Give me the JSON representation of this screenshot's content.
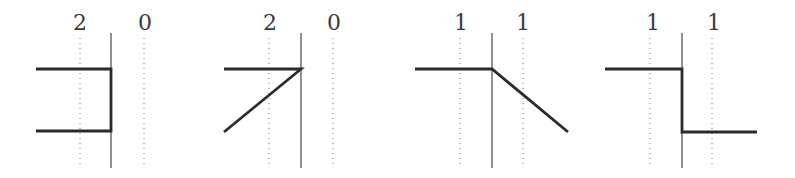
{
  "diagram": {
    "panels": [
      {
        "id": "panel-1",
        "labels": [
          {
            "text": "2",
            "x": 80
          },
          {
            "text": "0",
            "x": 145
          }
        ],
        "dotted_x": [
          80,
          144
        ],
        "axis_x": 111,
        "shape": "bracket",
        "path": "M36,69 L111,69 L111,131 L36,131"
      },
      {
        "id": "panel-2",
        "labels": [
          {
            "text": "2",
            "x": 270
          },
          {
            "text": "0",
            "x": 334
          }
        ],
        "dotted_x": [
          269,
          333
        ],
        "axis_x": 301,
        "shape": "angle",
        "path": "M224,69 L301,69 L224,132"
      },
      {
        "id": "panel-3",
        "labels": [
          {
            "text": "1",
            "x": 461
          },
          {
            "text": "1",
            "x": 523
          }
        ],
        "dotted_x": [
          460,
          523
        ],
        "axis_x": 492,
        "shape": "ramp-down",
        "path": "M415,69 L492,69 L568,132"
      },
      {
        "id": "panel-4",
        "labels": [
          {
            "text": "1",
            "x": 653
          },
          {
            "text": "1",
            "x": 714
          }
        ],
        "dotted_x": [
          650,
          712
        ],
        "axis_x": 682,
        "shape": "step-down",
        "path": "M605,69 L682,69 L682,132 L757,132"
      }
    ],
    "axis_top_y": 33,
    "axis_bottom_y": 168,
    "dotted_top_y": 38,
    "dotted_bottom_y": 166,
    "label_baseline_y": 30
  }
}
